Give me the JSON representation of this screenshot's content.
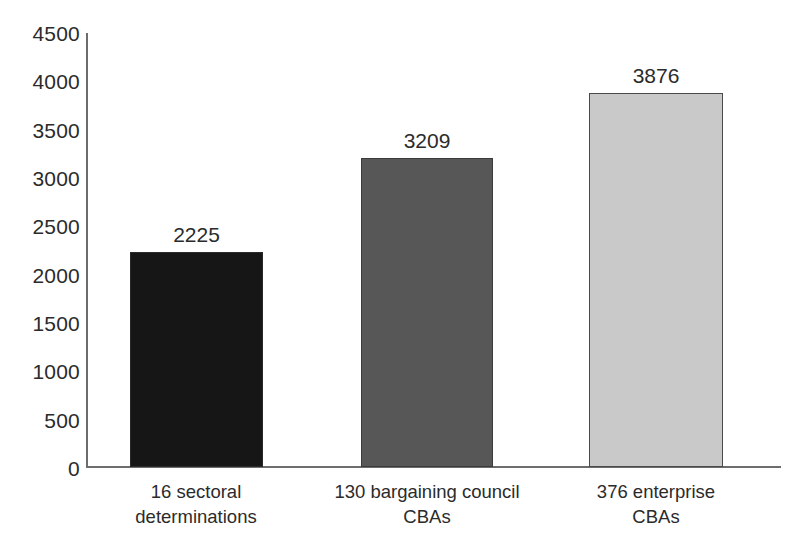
{
  "chart_data": {
    "type": "bar",
    "title": "",
    "subtitle": "",
    "xlabel": "",
    "ylabel": "",
    "categories": [
      "16 sectoral determinations",
      "130 bargaining council CBAs",
      "376 enterprise CBAs"
    ],
    "category_lines": [
      [
        "16 sectoral",
        "determinations"
      ],
      [
        "130 bargaining council",
        "CBAs"
      ],
      [
        "376 enterprise",
        "CBAs"
      ]
    ],
    "values": [
      2225,
      3209,
      3876
    ],
    "value_labels": [
      "2225",
      "3209",
      "3876"
    ],
    "bar_colors": [
      "#161616",
      "#575757",
      "#c9c9c9"
    ],
    "ylim": [
      0,
      4500
    ],
    "ytick_values": [
      4500,
      4000,
      3500,
      3000,
      2500,
      2000,
      1500,
      1000,
      500,
      0
    ],
    "ytick_labels": [
      "4500",
      "4000",
      "3500",
      "3000",
      "2500",
      "2000",
      "1500",
      "1000",
      "500",
      "0"
    ],
    "grid": false,
    "legend": "none",
    "axis_color": "#6d6d6d",
    "text_color": "#2b2b2b",
    "background": "#ffffff"
  }
}
